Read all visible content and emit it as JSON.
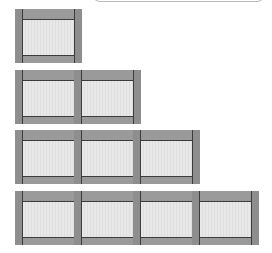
{
  "diagram": {
    "type": "growing-pattern",
    "description_visible": "",
    "colors": {
      "frame": "#8e8e8e",
      "band": "#9a9a9a",
      "line": "#3c3c3c",
      "pane": "#e8e8e8"
    },
    "rows": [
      {
        "index": 1,
        "tiles": 1,
        "top": 9
      },
      {
        "index": 2,
        "tiles": 2,
        "top": 70
      },
      {
        "index": 3,
        "tiles": 3,
        "top": 130
      },
      {
        "index": 4,
        "tiles": 4,
        "top": 191
      }
    ]
  },
  "callout": {
    "text": ""
  }
}
